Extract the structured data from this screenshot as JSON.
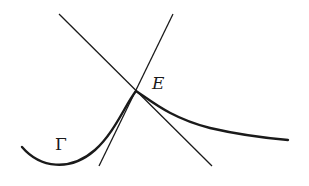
{
  "diagram": {
    "colors": {
      "stroke": "#1a1a1a",
      "background": "#ffffff"
    },
    "labels": {
      "point": "E",
      "curve": "Γ"
    },
    "elements": {
      "curve": {
        "name": "Γ",
        "path": "M22,147 C40,168 70,172 95,150 C115,132 125,105 136,91 C150,100 170,118 210,128 C240,135 265,138 288,140"
      },
      "line_1": {
        "x1": 59,
        "y1": 14,
        "x2": 212,
        "y2": 166
      },
      "line_2": {
        "x1": 173,
        "y1": 14,
        "x2": 99,
        "y2": 166
      },
      "intersection": {
        "name": "E",
        "x": 136,
        "y": 91
      }
    }
  }
}
